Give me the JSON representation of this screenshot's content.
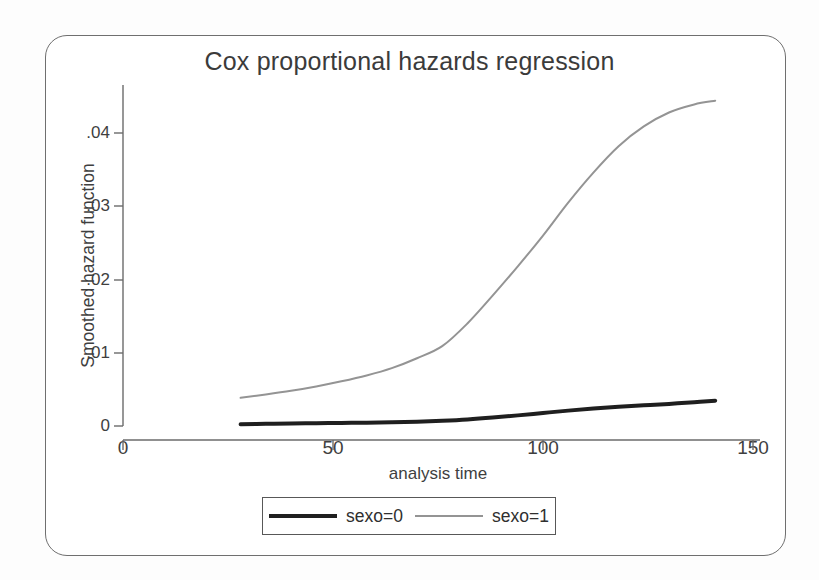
{
  "chart_data": {
    "type": "line",
    "title": "Cox proportional hazards regression",
    "xlabel": "analysis time",
    "ylabel": "Smoothed hazard function",
    "xlim": [
      0,
      150
    ],
    "ylim": [
      0,
      0.0455
    ],
    "xticks": [
      0,
      50,
      100,
      150
    ],
    "xtick_labels": [
      "0",
      "50",
      "100",
      "150"
    ],
    "yticks": [
      0,
      0.01,
      0.02,
      0.03,
      0.04
    ],
    "ytick_labels": [
      "0",
      ".01",
      ".02",
      ".03",
      ".04"
    ],
    "grid": false,
    "legend_position": "bottom-center",
    "series": [
      {
        "name": "sexo=0",
        "color": "#1f1f1f",
        "linewidth": 4,
        "x": [
          28,
          34,
          40,
          46,
          52,
          58,
          64,
          70,
          76,
          82,
          88,
          94,
          100,
          106,
          112,
          118,
          124,
          130,
          136,
          141
        ],
        "y": [
          0.00025,
          0.0003,
          0.00035,
          0.00038,
          0.00042,
          0.00045,
          0.0005,
          0.00058,
          0.00072,
          0.0009,
          0.00115,
          0.00145,
          0.00178,
          0.0021,
          0.00238,
          0.00262,
          0.00282,
          0.00302,
          0.00325,
          0.00345
        ]
      },
      {
        "name": "sexo=1",
        "color": "#949494",
        "linewidth": 2,
        "x": [
          28,
          34,
          40,
          46,
          52,
          58,
          64,
          70,
          76,
          82,
          88,
          94,
          100,
          106,
          112,
          118,
          124,
          130,
          136,
          141
        ],
        "y": [
          0.00385,
          0.0043,
          0.0048,
          0.0054,
          0.0061,
          0.0069,
          0.0079,
          0.00925,
          0.0109,
          0.014,
          0.0178,
          0.0218,
          0.026,
          0.0305,
          0.0346,
          0.0382,
          0.0409,
          0.0428,
          0.0439,
          0.0444
        ]
      }
    ]
  },
  "legend": {
    "entries": [
      {
        "label": "sexo=0"
      },
      {
        "label": "sexo=1"
      }
    ]
  }
}
